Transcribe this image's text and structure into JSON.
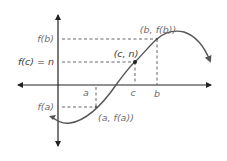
{
  "diagram": {
    "colors": {
      "axis": "#222222",
      "curve": "#555555",
      "dashed": "#555555",
      "label": "#6e6e6e",
      "label_dark": "#3a3a3a",
      "point": "#222222"
    },
    "x_axis_labels": {
      "a": "a",
      "c": "c",
      "b": "b"
    },
    "y_axis_labels": {
      "fb": "f(b)",
      "fc": "f(c) = n",
      "fa": "f(a)"
    },
    "points": {
      "b_point": "(b, f(b))",
      "c_point": "(c, n)",
      "a_point": "(a, f(a))"
    }
  }
}
